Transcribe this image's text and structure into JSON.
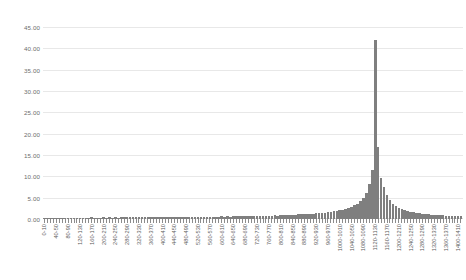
{
  "chart_data": {
    "type": "bar",
    "title": "",
    "subtitle": "",
    "xlabel": "",
    "ylabel": "",
    "grid": true,
    "legend": false,
    "ylim": [
      0,
      45
    ],
    "ytick_labels": [
      "45.00",
      "40.00",
      "35.00",
      "30.00",
      "25.00",
      "20.00",
      "15.00",
      "10.00",
      "5.00",
      "0.00"
    ],
    "ytick_values": [
      45,
      40,
      35,
      30,
      25,
      20,
      15,
      10,
      5,
      0
    ],
    "bar_color": "#7f7f7f",
    "gridline_color": "#e8e8e8",
    "xtick_label_interval": 4,
    "categories": [
      "0-10",
      "10-20",
      "20-30",
      "30-40",
      "40-50",
      "50-60",
      "60-70",
      "70-80",
      "80-90",
      "90-100",
      "100-110",
      "110-120",
      "120-130",
      "130-140",
      "140-150",
      "150-160",
      "160-170",
      "170-180",
      "180-190",
      "190-200",
      "200-210",
      "210-220",
      "220-230",
      "230-240",
      "240-250",
      "250-260",
      "260-270",
      "270-280",
      "280-290",
      "290-300",
      "300-310",
      "310-320",
      "320-330",
      "330-340",
      "340-350",
      "350-360",
      "360-370",
      "370-380",
      "380-390",
      "390-400",
      "400-410",
      "410-420",
      "420-430",
      "430-440",
      "440-450",
      "450-460",
      "460-470",
      "470-480",
      "480-490",
      "490-500",
      "500-510",
      "510-520",
      "520-530",
      "530-540",
      "540-550",
      "550-560",
      "560-570",
      "570-580",
      "580-590",
      "590-600",
      "600-610",
      "610-620",
      "620-630",
      "630-640",
      "640-650",
      "650-660",
      "660-670",
      "670-680",
      "680-690",
      "690-700",
      "700-710",
      "710-720",
      "720-730",
      "730-740",
      "740-750",
      "750-760",
      "760-770",
      "770-780",
      "780-790",
      "790-800",
      "800-810",
      "810-820",
      "820-830",
      "830-840",
      "840-850",
      "850-860",
      "860-870",
      "870-880",
      "880-890",
      "890-900",
      "900-910",
      "910-920",
      "920-930",
      "930-940",
      "940-950",
      "950-960",
      "960-970",
      "970-980",
      "980-990",
      "990-1000",
      "1000-1010",
      "1010-1020",
      "1020-1030",
      "1030-1040",
      "1040-1050",
      "1050-1060",
      "1060-1070",
      "1070-1080",
      "1080-1090",
      "1090-1100",
      "1100-1110",
      "1110-1120",
      "1120-1130",
      "1130-1140",
      "1140-1150",
      "1150-1160",
      "1160-1170",
      "1170-1180",
      "1180-1190",
      "1190-1200",
      "1200-1210",
      "1210-1220",
      "1220-1230",
      "1230-1240",
      "1240-1250",
      "1250-1260",
      "1260-1270",
      "1270-1280",
      "1280-1290",
      "1290-1300",
      "1300-1310",
      "1310-1320",
      "1320-1330",
      "1330-1340",
      "1340-1350",
      "1350-1360",
      "1360-1370",
      "1370-1380",
      "1380-1390",
      "1390-1400",
      "1400-1410",
      "1410-1420"
    ],
    "values": [
      0.35,
      0.25,
      0.3,
      0.22,
      0.28,
      0.24,
      0.3,
      0.26,
      0.32,
      0.28,
      0.34,
      0.26,
      0.3,
      0.28,
      0.34,
      0.3,
      0.36,
      0.3,
      0.34,
      0.32,
      0.38,
      0.32,
      0.36,
      0.34,
      0.4,
      0.34,
      0.38,
      0.36,
      0.42,
      0.36,
      0.4,
      0.38,
      0.44,
      0.38,
      0.42,
      0.4,
      0.46,
      0.4,
      0.44,
      0.42,
      0.48,
      0.42,
      0.46,
      0.44,
      0.5,
      0.44,
      0.48,
      0.46,
      0.52,
      0.46,
      0.5,
      0.48,
      0.55,
      0.5,
      0.54,
      0.52,
      0.58,
      0.52,
      0.56,
      0.54,
      0.62,
      0.56,
      0.6,
      0.58,
      0.66,
      0.6,
      0.64,
      0.62,
      0.7,
      0.64,
      0.7,
      0.68,
      0.76,
      0.7,
      0.76,
      0.74,
      0.82,
      0.78,
      0.84,
      0.82,
      0.9,
      0.86,
      0.94,
      0.92,
      1.02,
      0.98,
      1.08,
      1.06,
      1.18,
      1.14,
      1.26,
      1.24,
      1.4,
      1.36,
      1.5,
      1.48,
      1.66,
      1.62,
      1.8,
      1.86,
      2.1,
      2.2,
      2.4,
      2.6,
      2.9,
      3.2,
      3.6,
      4.2,
      5.0,
      6.2,
      8.2,
      11.6,
      42.0,
      16.8,
      9.6,
      7.4,
      5.6,
      4.4,
      3.6,
      3.0,
      2.6,
      2.3,
      2.05,
      1.85,
      1.7,
      1.55,
      1.45,
      1.35,
      1.25,
      1.18,
      1.1,
      1.04,
      0.98,
      0.92,
      0.88,
      0.84,
      0.8,
      0.76,
      0.72,
      0.68,
      0.64,
      0.6
    ]
  }
}
